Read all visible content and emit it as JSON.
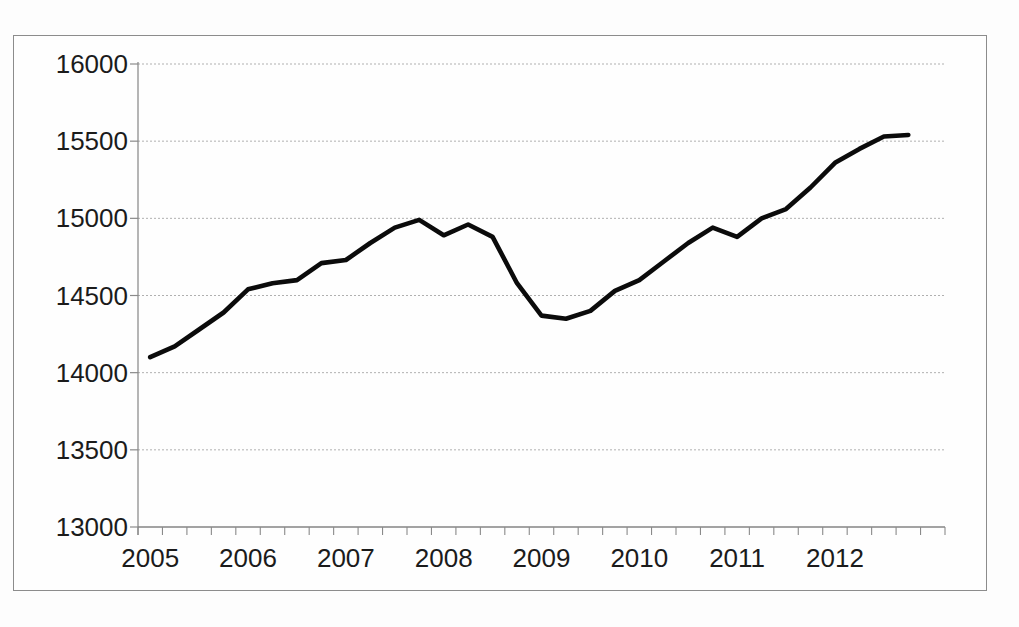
{
  "chart_data": {
    "type": "line",
    "title": "",
    "legend": "none",
    "grid": "horizontal",
    "x_axis": {
      "tick_labels": [
        "2005",
        "2006",
        "2007",
        "2008",
        "2009",
        "2010",
        "2011",
        "2012"
      ],
      "minor_ticks": "quarterly"
    },
    "y_axis": {
      "tick_labels": [
        "16000",
        "15500",
        "15000",
        "14500",
        "14000",
        "13500",
        "13000"
      ],
      "range": [
        13000,
        16000
      ],
      "step": 500
    },
    "ylim": [
      13000,
      16000
    ],
    "categories": [
      "2005 Q1",
      "2005 Q2",
      "2005 Q3",
      "2005 Q4",
      "2006 Q1",
      "2006 Q2",
      "2006 Q3",
      "2006 Q4",
      "2007 Q1",
      "2007 Q2",
      "2007 Q3",
      "2007 Q4",
      "2008 Q1",
      "2008 Q2",
      "2008 Q3",
      "2008 Q4",
      "2009 Q1",
      "2009 Q2",
      "2009 Q3",
      "2009 Q4",
      "2010 Q1",
      "2010 Q2",
      "2010 Q3",
      "2010 Q4",
      "2011 Q1",
      "2011 Q2",
      "2011 Q3",
      "2011 Q4",
      "2012 Q1",
      "2012 Q2",
      "2012 Q3",
      "2012 Q4"
    ],
    "series": [
      {
        "name": "quarterly-series",
        "color": "#0b0b0b",
        "values": [
          14100,
          14170,
          14280,
          14390,
          14540,
          14580,
          14600,
          14710,
          14730,
          14840,
          14940,
          14990,
          14890,
          14960,
          14880,
          14580,
          14370,
          14350,
          14400,
          14530,
          14600,
          14720,
          14840,
          14940,
          14880,
          15000,
          15060,
          15200,
          15360,
          15450,
          15530,
          15540
        ]
      }
    ],
    "colors": {
      "gridline": "#b0b0b0",
      "axis": "#848484",
      "tick": "#8a8a8a",
      "label": "#1b1b1b",
      "frame_border": "#8c8c8c",
      "background": "#fdfdfd"
    }
  }
}
